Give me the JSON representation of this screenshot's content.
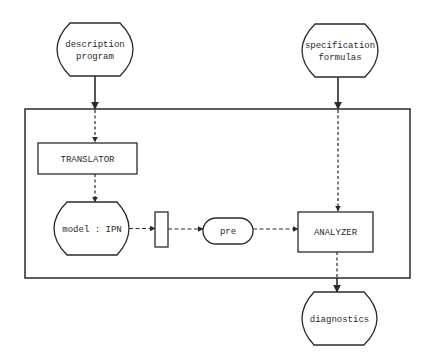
{
  "diagram": {
    "colors": {
      "ink": "#2a2a2a",
      "background": "#ffffff"
    },
    "nodes": {
      "description_program": {
        "line1": "description",
        "line2": "program",
        "shape": "rounded-barrel"
      },
      "specification_formulas": {
        "line1": "specification",
        "line2": "formulas",
        "shape": "rounded-barrel"
      },
      "translator": {
        "label": "TRANSLATOR",
        "shape": "rectangle"
      },
      "model_ipn": {
        "label": "model : IPN",
        "shape": "rounded-barrel"
      },
      "transition": {
        "label": "",
        "shape": "narrow-rectangle"
      },
      "pre": {
        "label": "pre",
        "shape": "stadium"
      },
      "analyzer": {
        "label": "ANALYZER",
        "shape": "rectangle"
      },
      "diagnostics": {
        "label": "diagnostics",
        "shape": "rounded-barrel"
      }
    },
    "edges": [
      {
        "from": "description_program",
        "to": "translator",
        "style": "solid-then-dashed"
      },
      {
        "from": "translator",
        "to": "model_ipn",
        "style": "dashed"
      },
      {
        "from": "model_ipn",
        "to": "transition",
        "style": "dashed"
      },
      {
        "from": "transition",
        "to": "pre",
        "style": "dashed"
      },
      {
        "from": "pre",
        "to": "analyzer",
        "style": "dashed"
      },
      {
        "from": "specification_formulas",
        "to": "analyzer",
        "style": "solid-then-dotted"
      },
      {
        "from": "analyzer",
        "to": "diagnostics",
        "style": "dotted-then-solid"
      }
    ],
    "container": {
      "label": "",
      "shape": "rectangle"
    }
  }
}
